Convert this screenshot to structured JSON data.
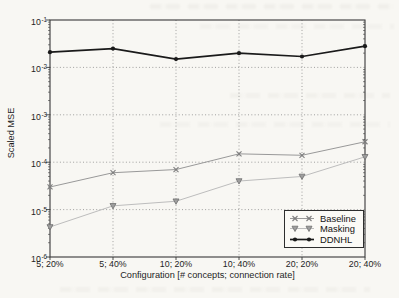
{
  "chart_data": {
    "type": "line",
    "title": "",
    "xlabel": "Configuration [# concepts; connection rate]",
    "ylabel": "Scaled MSE",
    "x_categories": [
      "5; 20%",
      "5; 40%",
      "10; 20%",
      "10; 40%",
      "20; 20%",
      "20; 40%"
    ],
    "y_scale": "log",
    "ylim": [
      1e-06,
      0.1
    ],
    "ytick_exponents": [
      -1,
      -2,
      -3,
      -4,
      -5,
      -6
    ],
    "grid": true,
    "legend_position": "lower right",
    "series": [
      {
        "name": "Baseline",
        "marker": "x",
        "color": "#999999",
        "marker_color": "#7d7d7d",
        "line_width": 1,
        "values": [
          3e-05,
          6e-05,
          7e-05,
          0.00015,
          0.00014,
          0.00027
        ]
      },
      {
        "name": "Masking",
        "marker": "triangle-down",
        "color": "#bdbdbd",
        "marker_color": "#6e6e6e",
        "marker_fill": "#9e9e9e",
        "line_width": 1,
        "values": [
          4.3e-06,
          1.2e-05,
          1.5e-05,
          4e-05,
          5e-05,
          0.00013
        ]
      },
      {
        "name": "DDNHL",
        "marker": "dot",
        "color": "#1a1a1a",
        "marker_color": "#1a1a1a",
        "line_width": 1.7,
        "values": [
          0.021,
          0.025,
          0.015,
          0.02,
          0.017,
          0.028
        ]
      }
    ]
  }
}
